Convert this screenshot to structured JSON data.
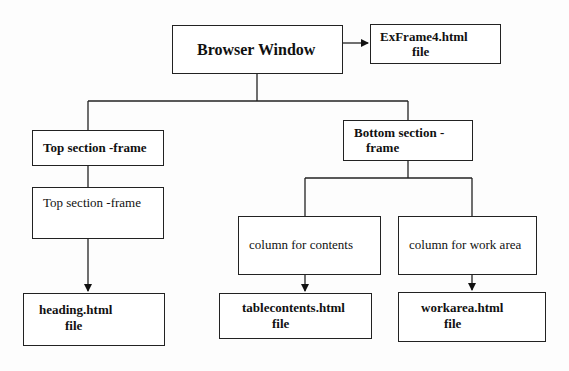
{
  "diagram": {
    "type": "hierarchy",
    "nodes": [
      {
        "id": "browser",
        "label": "Browser Window",
        "bold": true
      },
      {
        "id": "exframe",
        "label_line1": "ExFrame4.html",
        "label_line2": "file",
        "bold": true
      },
      {
        "id": "top_frame",
        "label": "Top section -frame",
        "bold": true
      },
      {
        "id": "top_content",
        "label": "Top section -frame",
        "bold": false
      },
      {
        "id": "heading",
        "label_line1": "heading.html",
        "label_line2": "file",
        "bold": true
      },
      {
        "id": "bottom_frame",
        "label_line1": "Bottom section -",
        "label_line2": "frame",
        "bold": true
      },
      {
        "id": "col_contents",
        "label": "column for contents",
        "bold": false
      },
      {
        "id": "col_work",
        "label": "column for work area",
        "bold": false
      },
      {
        "id": "tablecontents",
        "label_line1": "tablecontents.html",
        "label_line2": "file",
        "bold": true
      },
      {
        "id": "workarea",
        "label_line1": "workarea.html",
        "label_line2": "file",
        "bold": true
      }
    ],
    "edges": [
      {
        "from": "browser",
        "to": "exframe",
        "arrow": true
      },
      {
        "from": "browser",
        "to": "top_frame",
        "arrow": false
      },
      {
        "from": "browser",
        "to": "bottom_frame",
        "arrow": false
      },
      {
        "from": "top_frame",
        "to": "top_content",
        "arrow": false
      },
      {
        "from": "top_content",
        "to": "heading",
        "arrow": true
      },
      {
        "from": "bottom_frame",
        "to": "col_contents",
        "arrow": false
      },
      {
        "from": "bottom_frame",
        "to": "col_work",
        "arrow": false
      },
      {
        "from": "col_contents",
        "to": "tablecontents",
        "arrow": true
      },
      {
        "from": "col_work",
        "to": "workarea",
        "arrow": true
      }
    ]
  },
  "labels": {
    "browser": "Browser Window",
    "exframe_1": "ExFrame4.html",
    "exframe_2": "file",
    "top_frame": "Top section -frame",
    "top_content": "Top section -frame",
    "heading_1": "heading.html",
    "heading_2": "file",
    "bottom_frame_1": "Bottom section -",
    "bottom_frame_2": "frame",
    "col_contents": "column for contents",
    "col_work": "column for work area",
    "tablecontents_1": "tablecontents.html",
    "tablecontents_2": "file",
    "workarea_1": "workarea.html",
    "workarea_2": "file"
  }
}
